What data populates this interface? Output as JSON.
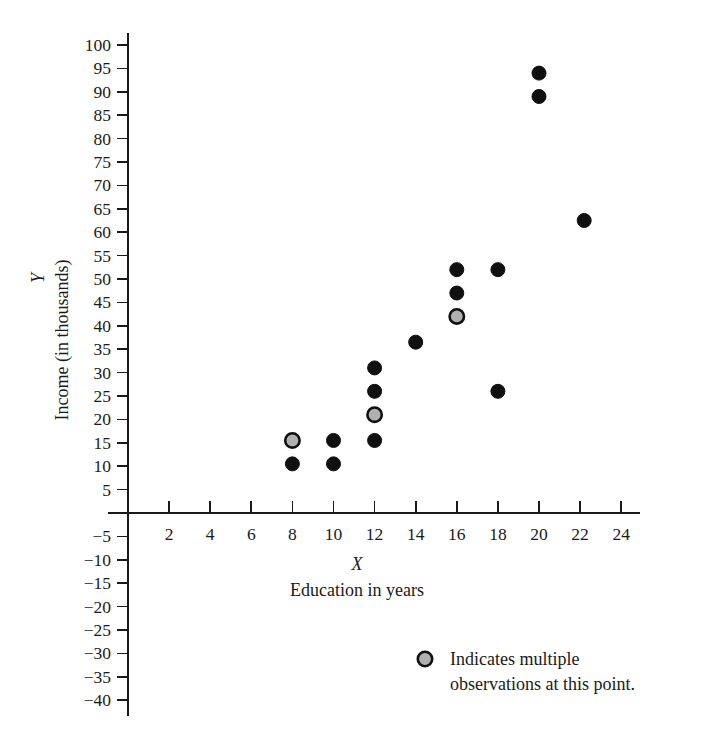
{
  "chart_data": {
    "type": "scatter",
    "title": "",
    "xlabel": "X",
    "xlabel_sub": "Education in years",
    "ylabel": "Y",
    "ylabel_sub": "Income (in thousands)",
    "xlim": [
      0,
      25.5
    ],
    "ylim": [
      -42,
      102
    ],
    "grid": false,
    "legend_position": "inside-bottom-right",
    "x_ticks": [
      2,
      4,
      6,
      8,
      10,
      12,
      14,
      16,
      18,
      20,
      22,
      24
    ],
    "x_tick_labels": [
      "2",
      "4",
      "6",
      "8",
      "10",
      "12",
      "14",
      "16",
      "18",
      "20",
      "22",
      "24"
    ],
    "y_ticks": [
      100,
      95,
      90,
      85,
      80,
      75,
      70,
      65,
      60,
      55,
      50,
      45,
      40,
      35,
      30,
      25,
      20,
      15,
      10,
      5,
      -5,
      -10,
      -15,
      -20,
      -25,
      -30,
      -35,
      -40
    ],
    "y_tick_labels": [
      "100",
      "95",
      "90",
      "85",
      "80",
      "75",
      "70",
      "65",
      "60",
      "55",
      "50",
      "45",
      "40",
      "35",
      "30",
      "25",
      "20",
      "15",
      "10",
      "5",
      "−5",
      "−10",
      "−15",
      "−20",
      "−25",
      "−30",
      "−35",
      "−40"
    ],
    "marker_colors": {
      "single_fill": "#101010",
      "multiple_fill": "#b0b0b0",
      "multiple_stroke": "#101010"
    },
    "points": [
      {
        "x": 8,
        "y": 15.5,
        "multiple": true
      },
      {
        "x": 8,
        "y": 10.5,
        "multiple": false
      },
      {
        "x": 10,
        "y": 15.5,
        "multiple": false
      },
      {
        "x": 10,
        "y": 10.5,
        "multiple": false
      },
      {
        "x": 12,
        "y": 31.0,
        "multiple": false
      },
      {
        "x": 12,
        "y": 26.0,
        "multiple": false
      },
      {
        "x": 12,
        "y": 21.0,
        "multiple": true
      },
      {
        "x": 12,
        "y": 15.5,
        "multiple": false
      },
      {
        "x": 14,
        "y": 36.5,
        "multiple": false
      },
      {
        "x": 16,
        "y": 52.0,
        "multiple": false
      },
      {
        "x": 16,
        "y": 47.0,
        "multiple": false
      },
      {
        "x": 16,
        "y": 42.0,
        "multiple": true
      },
      {
        "x": 18,
        "y": 52.0,
        "multiple": false
      },
      {
        "x": 18,
        "y": 26.0,
        "multiple": false
      },
      {
        "x": 20,
        "y": 94.0,
        "multiple": false
      },
      {
        "x": 20,
        "y": 89.0,
        "multiple": false
      },
      {
        "x": 22.2,
        "y": 62.5,
        "multiple": false
      }
    ],
    "legend": {
      "marker": "multiple-observation-marker",
      "line1": "Indicates multiple",
      "line2": "observations at this point."
    }
  }
}
